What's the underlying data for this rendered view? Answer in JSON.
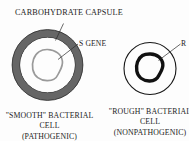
{
  "figure": {
    "background_color": "#fdfdfd",
    "ink_color": "#1c1c1c",
    "capsule_gray": "#6e6e6e",
    "gene_gray": "#9a9a9a"
  },
  "annotations": {
    "carbohydrate_capsule": "CARBOHYDRATE CAPSULE",
    "s_gene": "S GENE",
    "r_gene": "R"
  },
  "smooth_cell": {
    "caption_line_1": "\"SMOOTH\" BACTERIAL",
    "caption_line_2": "CELL",
    "caption_line_3": "(PATHOGENIC)"
  },
  "rough_cell": {
    "caption_line_1": "\"ROUGH\" BACTERIAL",
    "caption_line_2": "CELL",
    "caption_line_3": "(NONPATHOGENIC)"
  }
}
